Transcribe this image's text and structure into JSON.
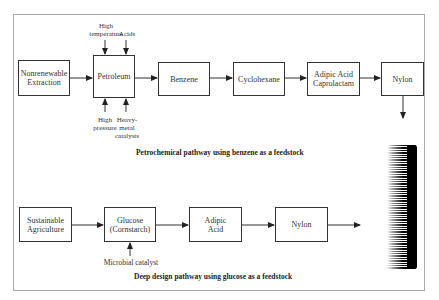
{
  "diagram": {
    "petrochemical": {
      "caption": "Petrochemical pathway using benzene as a feedstock",
      "nodes": [
        {
          "id": "nonrenewable",
          "line1": "Nonrenewable",
          "line2": "Extraction"
        },
        {
          "id": "petroleum",
          "line1": "Petroleum",
          "line2": ""
        },
        {
          "id": "benzene",
          "line1": "Benzene",
          "line2": ""
        },
        {
          "id": "cyclohexane",
          "line1": "Cyclohexane",
          "line2": ""
        },
        {
          "id": "adipic-caprolactam",
          "line1": "Adipic Acid",
          "line2": "Caprolactam"
        },
        {
          "id": "nylon",
          "line1": "Nylon",
          "line2": ""
        }
      ],
      "inputs_top": [
        {
          "line1": "High",
          "line2": "temperature"
        },
        {
          "line1": "Acids",
          "line2": ""
        }
      ],
      "inputs_bottom": [
        {
          "line1": "High",
          "line2": "pressure",
          "line3": ""
        },
        {
          "line1": "Heavy-",
          "line2": "metal",
          "line3": "catalysts"
        }
      ]
    },
    "deep_design": {
      "caption": "Deep design pathway using glucose as a feedstock",
      "nodes": [
        {
          "id": "sustainable-agriculture",
          "line1": "Sustainable",
          "line2": "Agriculture"
        },
        {
          "id": "glucose",
          "line1": "Glucose",
          "line2": "(Cornstarch)"
        },
        {
          "id": "adipic-acid",
          "line1": "Adipic",
          "line2": "Acid"
        },
        {
          "id": "nylon",
          "line1": "Nylon",
          "line2": ""
        }
      ],
      "inputs_bottom": [
        {
          "line1": "Microbial catalyst"
        }
      ]
    },
    "decoration": {
      "comb_icon": "comb-icon"
    },
    "colors": {
      "stroke": "#333333",
      "frame": "#a8a8a8",
      "background": "#ffffff"
    }
  }
}
